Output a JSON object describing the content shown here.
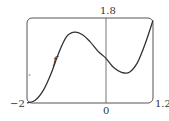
{
  "chart_data": {
    "type": "line",
    "title": "",
    "xlabel": "",
    "ylabel": "",
    "xlim": [
      -2,
      1.2
    ],
    "ylim": [
      0,
      1.8
    ],
    "grid": false,
    "tick_labels": {
      "x_min": "−2",
      "x_zero": "0",
      "x_max": "1.2",
      "y_max": "1.8"
    },
    "series": [
      {
        "name": "f",
        "label": "f",
        "x": [
          -2.0,
          -1.8,
          -1.6,
          -1.4,
          -1.2,
          -1.0,
          -0.8,
          -0.6,
          -0.4,
          -0.2,
          0.0,
          0.2,
          0.4,
          0.6,
          0.8,
          1.0,
          1.2
        ],
        "y": [
          0.0,
          0.05,
          0.25,
          0.6,
          1.05,
          1.4,
          1.5,
          1.45,
          1.3,
          1.1,
          0.95,
          0.75,
          0.65,
          0.65,
          0.85,
          1.25,
          1.75
        ]
      }
    ],
    "annotations": [
      {
        "text": "f",
        "near_x": -1.4,
        "near_y": 0.9
      }
    ]
  }
}
